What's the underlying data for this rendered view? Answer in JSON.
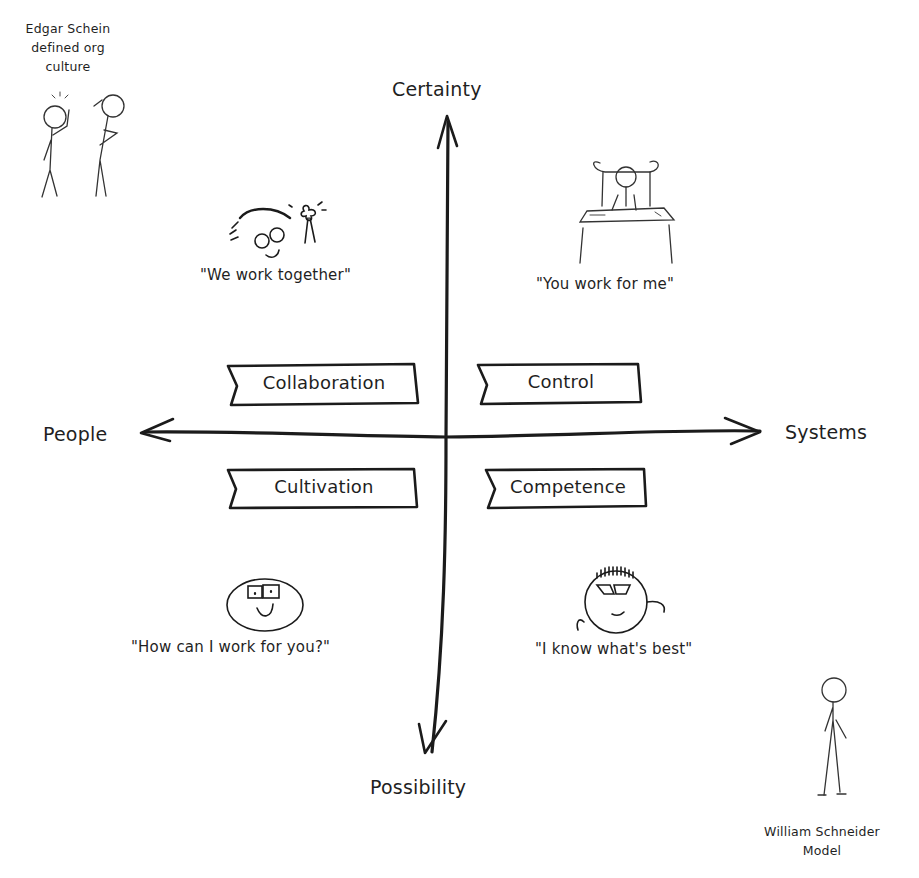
{
  "diagram": {
    "type": "quadrant",
    "axes": {
      "top": "Certainty",
      "bottom": "Possibility",
      "left": "People",
      "right": "Systems"
    },
    "quadrants": [
      {
        "position": "top-left",
        "label": "Collaboration",
        "quote": "\"We work together\"",
        "illustration": "thinking-face-with-glasses-and-pinwheel"
      },
      {
        "position": "top-right",
        "label": "Control",
        "quote": "\"You work for me\"",
        "illustration": "person-behind-desk"
      },
      {
        "position": "bottom-left",
        "label": "Cultivation",
        "quote": "\"How can I work for you?\"",
        "illustration": "smiling-face-with-glasses"
      },
      {
        "position": "bottom-right",
        "label": "Competence",
        "quote": "\"I know what's best\"",
        "illustration": "smug-face-with-spiky-hair"
      }
    ],
    "notes": {
      "top_left": [
        "Edgar Schein",
        "defined org",
        "culture"
      ],
      "bottom_right": [
        "William Schneider",
        "Model"
      ]
    },
    "colors": {
      "ink": "#1f1f1f",
      "background": "#ffffff"
    }
  }
}
